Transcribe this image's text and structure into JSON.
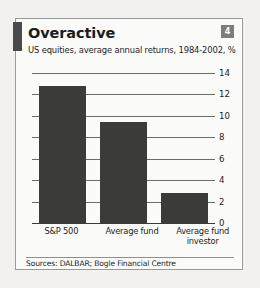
{
  "card": {
    "title": "Overactive",
    "subtitle": "US equities, average annual returns, 1984-2002, %",
    "badge": "4",
    "source": "Sources: DALBAR; Bogle Financial Centre",
    "accent_color": "#4a4a4a",
    "bar_color": "#3b3b3a",
    "badge_color": "#7d7d79",
    "border_color": "#9a9a96"
  },
  "chart_data": {
    "type": "bar",
    "title": "Overactive",
    "subtitle": "US equities, average annual returns, 1984-2002, %",
    "categories": [
      "S&P 500",
      "Average fund",
      "Average fund investor"
    ],
    "values": [
      12.8,
      9.4,
      2.8
    ],
    "series": [
      {
        "name": "Average annual return",
        "values": [
          12.8,
          9.4,
          2.8
        ]
      }
    ],
    "xlabel": "",
    "ylabel": "%",
    "ylim": [
      0,
      14
    ],
    "yticks": [
      0,
      2,
      4,
      6,
      8,
      10,
      12,
      14
    ],
    "ytick_labels": [
      "0",
      "2",
      "4",
      "6",
      "8",
      "10",
      "12",
      "14"
    ],
    "grid": true,
    "grid_orientation": "horizontal",
    "legend": false,
    "legend_position": "none",
    "source": "Sources: DALBAR; Bogle Financial Centre"
  }
}
